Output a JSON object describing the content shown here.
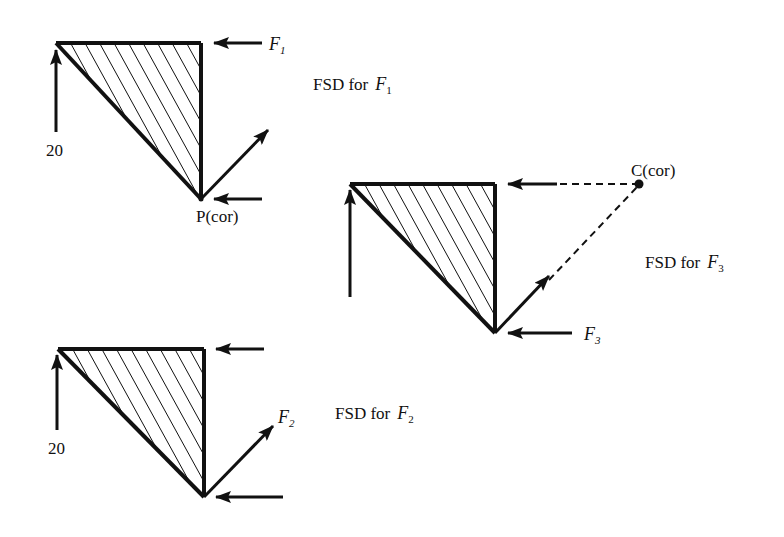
{
  "diagrams": [
    {
      "id": "f1",
      "caption": {
        "prefix": "FSD for",
        "force": "F",
        "sub": "1"
      },
      "left_force_label": "20",
      "top_force_label": {
        "force": "F",
        "sub": "1"
      },
      "diag_force_label": null,
      "bottom_force_label": null,
      "center_label": "P(cor)"
    },
    {
      "id": "f3",
      "caption": {
        "prefix": "FSD for",
        "force": "F",
        "sub": "3"
      },
      "left_force_label": null,
      "top_force_label": null,
      "diag_force_label": null,
      "bottom_force_label": {
        "force": "F",
        "sub": "3"
      },
      "center_label": "C(cor)"
    },
    {
      "id": "f2",
      "caption": {
        "prefix": "FSD for",
        "force": "F",
        "sub": "2"
      },
      "left_force_label": "20",
      "top_force_label": null,
      "diag_force_label": {
        "force": "F",
        "sub": "2"
      },
      "bottom_force_label": null,
      "center_label": null
    }
  ],
  "colors": {
    "ink": "#111111",
    "background": "#ffffff"
  }
}
